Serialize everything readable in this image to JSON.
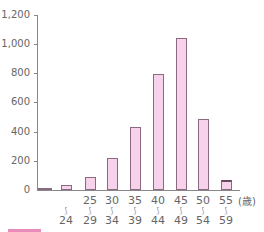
{
  "chart_data": {
    "type": "bar",
    "title": "",
    "xlabel": "(歳)",
    "ylabel": "",
    "ylim": [
      0,
      1200
    ],
    "yticks": [
      "0",
      "200",
      "400",
      "600",
      "800",
      "1,000",
      "1,200"
    ],
    "categories": [
      "~19",
      "~24",
      "25~29",
      "30~34",
      "35~39",
      "40~44",
      "45~49",
      "50~54",
      "55~59"
    ],
    "category_labels": [
      {
        "top": "",
        "bottom": ""
      },
      {
        "top": "",
        "bottom": "24"
      },
      {
        "top": "25",
        "bottom": "29"
      },
      {
        "top": "30",
        "bottom": "34"
      },
      {
        "top": "35",
        "bottom": "39"
      },
      {
        "top": "40",
        "bottom": "44"
      },
      {
        "top": "45",
        "bottom": "49"
      },
      {
        "top": "50",
        "bottom": "54"
      },
      {
        "top": "55",
        "bottom": "59"
      }
    ],
    "values": [
      5,
      35,
      88,
      220,
      430,
      795,
      1045,
      485,
      70
    ],
    "grid": false,
    "bar_color": "#f6d3ea",
    "bar_edge_color": "#8a6a80"
  },
  "unit_label": "(歳)",
  "tilde": "〜"
}
